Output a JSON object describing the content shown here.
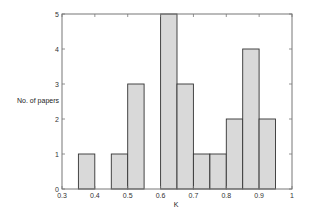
{
  "chart_data": {
    "type": "bar",
    "title": "",
    "xlabel": "K",
    "ylabel": "No. of papers",
    "xlim": [
      0.3,
      1.0
    ],
    "ylim": [
      0,
      5
    ],
    "bin_width": 0.05,
    "xticks": [
      "0.3",
      "0.4",
      "0.5",
      "0.6",
      "0.7",
      "0.8",
      "0.9",
      "1"
    ],
    "yticks": [
      "0",
      "1",
      "2",
      "3",
      "4",
      "5"
    ],
    "grid": false,
    "legend": null,
    "bins": [
      {
        "start": 0.35,
        "end": 0.4,
        "count": 1
      },
      {
        "start": 0.45,
        "end": 0.5,
        "count": 1
      },
      {
        "start": 0.5,
        "end": 0.55,
        "count": 3
      },
      {
        "start": 0.6,
        "end": 0.65,
        "count": 5
      },
      {
        "start": 0.65,
        "end": 0.7,
        "count": 3
      },
      {
        "start": 0.7,
        "end": 0.75,
        "count": 1
      },
      {
        "start": 0.75,
        "end": 0.8,
        "count": 1
      },
      {
        "start": 0.8,
        "end": 0.85,
        "count": 2
      },
      {
        "start": 0.85,
        "end": 0.9,
        "count": 4
      },
      {
        "start": 0.9,
        "end": 0.95,
        "count": 2
      }
    ],
    "categories": [
      "0.35-0.40",
      "0.45-0.50",
      "0.50-0.55",
      "0.60-0.65",
      "0.65-0.70",
      "0.70-0.75",
      "0.75-0.80",
      "0.80-0.85",
      "0.85-0.90",
      "0.90-0.95"
    ],
    "values": [
      1,
      1,
      3,
      5,
      3,
      1,
      1,
      2,
      4,
      2
    ],
    "colors": {
      "bar_fill": "#d9d9d9",
      "bar_stroke": "#333333",
      "axis": "#666666"
    }
  },
  "labels": {
    "ylabel": "No. of papers",
    "xlabel": "K"
  }
}
